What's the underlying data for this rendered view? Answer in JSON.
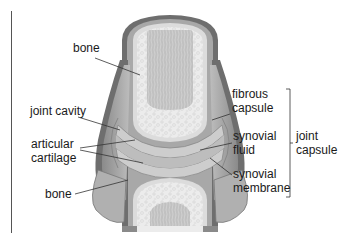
{
  "colors": {
    "outer_capsule": "#6e6e6e",
    "capsule_mid": "#9a9a9a",
    "capsule_light": "#c4c4c4",
    "spongy_bone": "#ececec",
    "marrow": "#bdbdbd",
    "cartilage": "#d6d6d6",
    "fluid": "#c9c9c9",
    "leader": "#333333"
  },
  "labels": {
    "bone_top": "bone",
    "joint_cavity": "joint cavity",
    "articular_cartilage_1": "articular",
    "articular_cartilage_2": "cartilage",
    "bone_bottom": "bone",
    "fibrous_capsule_1": "fibrous",
    "fibrous_capsule_2": "capsule",
    "synovial_fluid_1": "synovial",
    "synovial_fluid_2": "fluid",
    "synovial_membrane_1": "synovial",
    "synovial_membrane_2": "membrane",
    "joint_capsule_1": "joint",
    "joint_capsule_2": "capsule"
  }
}
